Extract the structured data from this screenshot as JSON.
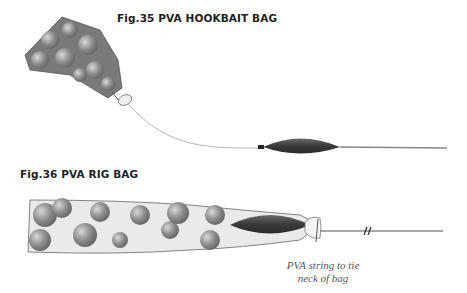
{
  "figures": [
    {
      "id": "fig35",
      "title": "Fig.35  PVA HOOKBAIT BAG"
    },
    {
      "id": "fig36",
      "title": "Fig.36 PVA RIG BAG",
      "caption_line1": "PVA string to tie",
      "caption_line2": "neck of bag"
    }
  ],
  "colors": {
    "lead": "#3e3e3e",
    "line": "#888888",
    "bag_outline": "#555555",
    "boilie": "#8a8a8a"
  }
}
